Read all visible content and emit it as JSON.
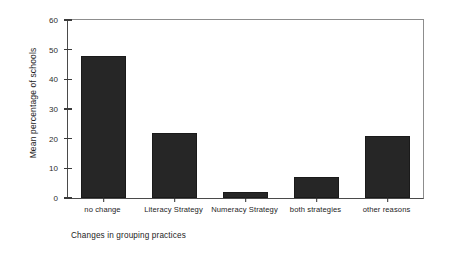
{
  "chart_data": {
    "type": "bar",
    "title": "",
    "xlabel": "Changes in grouping practices",
    "ylabel": "Mean percentage of schools",
    "categories": [
      "no change",
      "Literacy Strategy",
      "Numeracy Strategy",
      "both strategies",
      "other reasons"
    ],
    "values": [
      48,
      22,
      2,
      7,
      21
    ],
    "ylim": [
      0,
      60
    ],
    "yticks": [
      0,
      10,
      20,
      30,
      40,
      50,
      60
    ],
    "ytick_labels": [
      "0",
      "10",
      "20",
      "30",
      "40",
      "50",
      "60"
    ],
    "grid": false,
    "legend": false,
    "bar_color": "#262626",
    "frame_color": "#8d8d8d",
    "axis_color": "#4a4a4a",
    "background": "#ffffff"
  }
}
